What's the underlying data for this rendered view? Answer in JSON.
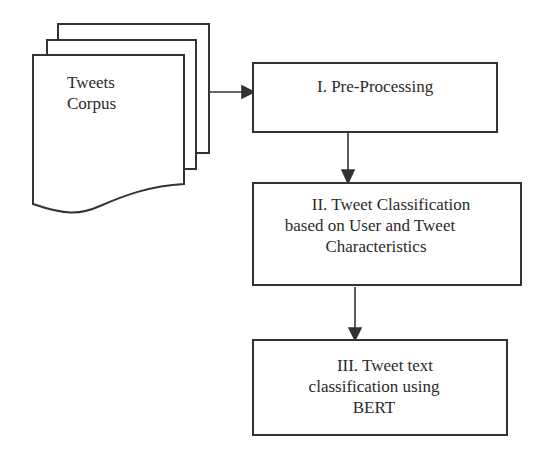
{
  "diagram": {
    "type": "flowchart",
    "source": {
      "label_line1": "Tweets",
      "label_line2": "Corpus",
      "shape": "stacked-documents"
    },
    "steps": [
      {
        "id": "step1",
        "lines": [
          "I. Pre-Processing"
        ]
      },
      {
        "id": "step2",
        "lines": [
          "II. Tweet Classification",
          "based on User and Tweet",
          "Characteristics"
        ]
      },
      {
        "id": "step3",
        "lines": [
          "III. Tweet text",
          "classification using",
          "BERT"
        ]
      }
    ],
    "edges": [
      {
        "from": "source",
        "to": "step1"
      },
      {
        "from": "step1",
        "to": "step2"
      },
      {
        "from": "step2",
        "to": "step3"
      }
    ],
    "colors": {
      "stroke": "#333333",
      "text": "#2a2a2a",
      "background": "#ffffff"
    }
  }
}
